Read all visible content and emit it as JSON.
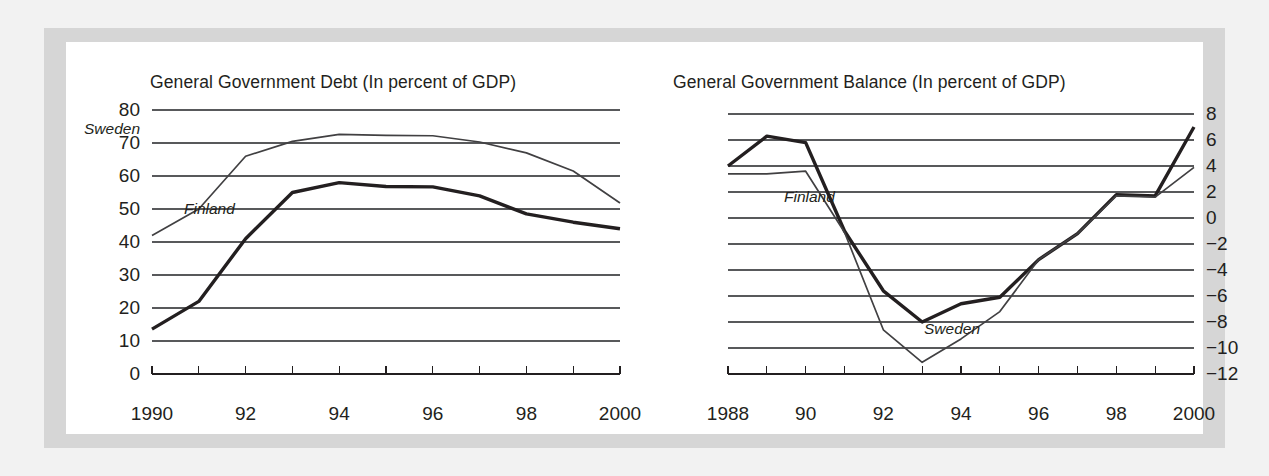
{
  "figure": {
    "background_color": "#f2f2f2",
    "mat_color": "#d6d6d6",
    "plot_background": "#ffffff"
  },
  "chart_data": [
    {
      "type": "line",
      "title": "General Government Debt (In percent of GDP)",
      "xlabel": "",
      "ylabel": "",
      "xlim": [
        1990,
        2000
      ],
      "ylim": [
        0,
        80
      ],
      "ytick_step": 10,
      "grid": true,
      "legend": "inline-annotations",
      "x": [
        1990,
        1991,
        1992,
        1993,
        1994,
        1995,
        1996,
        1997,
        1998,
        1999,
        2000
      ],
      "yticks": [
        "0",
        "10",
        "20",
        "30",
        "40",
        "50",
        "60",
        "70",
        "80"
      ],
      "ytick_values": [
        0,
        10,
        20,
        30,
        40,
        50,
        60,
        70,
        80
      ],
      "xticks": [
        "1990",
        "",
        "92",
        "",
        "94",
        "",
        "96",
        "",
        "98",
        "",
        "2000"
      ],
      "xtick_values": [
        1990,
        1991,
        1992,
        1993,
        1994,
        1995,
        1996,
        1997,
        1998,
        1999,
        2000
      ],
      "series": [
        {
          "name": "Sweden",
          "style": "thin",
          "color": "#414042",
          "values": [
            42.0,
            50.0,
            66.0,
            70.5,
            72.6,
            72.3,
            72.2,
            70.3,
            67.0,
            61.5,
            51.8
          ]
        },
        {
          "name": "Finland",
          "style": "thick",
          "color": "#231f20",
          "values": [
            13.6,
            22.0,
            41.0,
            55.0,
            58.0,
            56.8,
            56.7,
            54.0,
            48.5,
            46.0,
            44.0
          ]
        }
      ],
      "annotations": [
        {
          "text": "Sweden",
          "near_x": 1990.7,
          "near_y": 63.0
        },
        {
          "text": "Finland",
          "near_x": 1992.3,
          "near_y": 42.5
        }
      ]
    },
    {
      "type": "line",
      "title": "General Government Balance (In percent of GDP)",
      "xlabel": "",
      "ylabel": "",
      "xlim": [
        1988,
        2000
      ],
      "ylim": [
        -12,
        8
      ],
      "ytick_step": 2,
      "grid": true,
      "legend": "inline-annotations",
      "x": [
        1988,
        1989,
        1990,
        1991,
        1992,
        1993,
        1994,
        1995,
        1996,
        1997,
        1998,
        1999,
        2000
      ],
      "yticks": [
        "8",
        "6",
        "4",
        "2",
        "0",
        "-2",
        "-4",
        "-6",
        "-8",
        "-10",
        "-12"
      ],
      "ytick_values": [
        8,
        6,
        4,
        2,
        0,
        -2,
        -4,
        -6,
        -8,
        -10,
        -12
      ],
      "xticks": [
        "1988",
        "",
        "90",
        "",
        "92",
        "",
        "94",
        "",
        "96",
        "",
        "98",
        "",
        "2000"
      ],
      "xtick_values": [
        1988,
        1989,
        1990,
        1991,
        1992,
        1993,
        1994,
        1995,
        1996,
        1997,
        1998,
        1999,
        2000
      ],
      "series": [
        {
          "name": "Finland",
          "style": "thick",
          "color": "#231f20",
          "values": [
            4.0,
            6.3,
            5.8,
            -1.0,
            -5.6,
            -8.0,
            -6.6,
            -6.1,
            -3.2,
            -1.2,
            1.8,
            1.7,
            7.0
          ]
        },
        {
          "name": "Sweden",
          "style": "thin",
          "color": "#414042",
          "values": [
            3.4,
            3.4,
            3.6,
            -1.1,
            -8.6,
            -11.1,
            -9.3,
            -7.2,
            -3.2,
            -1.2,
            1.7,
            1.6,
            3.9
          ]
        }
      ],
      "annotations": [
        {
          "text": "Finland",
          "near_x": 1989.9,
          "near_y": 3.3
        },
        {
          "text": "Sweden",
          "near_x": 1994.3,
          "near_y": -9.2
        }
      ]
    }
  ]
}
